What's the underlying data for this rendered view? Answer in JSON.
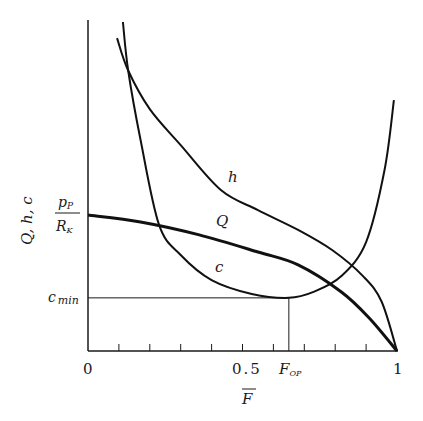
{
  "chart_data": {
    "type": "line",
    "title": "",
    "xlabel": "F̄",
    "ylabel": "Q, h, c",
    "xlim": [
      0,
      1
    ],
    "ylim": [
      0,
      1
    ],
    "grid": false,
    "legend": "inline curve labels",
    "x_tick_labels": [
      "0",
      "0.5",
      "1"
    ],
    "x_minor_ticks": [
      0.1,
      0.2,
      0.3,
      0.4,
      0.5,
      0.6,
      0.7,
      0.8,
      0.9
    ],
    "annotations": {
      "y_marker_pp_rk": {
        "label_num": "p_P",
        "label_den": "R_K",
        "y": 0.412
      },
      "y_marker_cmin": {
        "label": "c",
        "label_sub": "min",
        "y": 0.161
      },
      "x_marker_fop": {
        "label": "F",
        "label_sub": "OP",
        "x": 0.65
      }
    },
    "series": [
      {
        "name": "Q",
        "x": [
          0,
          0.17,
          0.36,
          0.55,
          0.68,
          0.82,
          0.91,
          1.0
        ],
        "y": [
          0.412,
          0.391,
          0.352,
          0.3,
          0.261,
          0.179,
          0.1,
          0.0
        ]
      },
      {
        "name": "h",
        "x": [
          0.094,
          0.13,
          0.2,
          0.3,
          0.43,
          0.55,
          0.68,
          0.79,
          0.89,
          0.95,
          1.0
        ],
        "y": [
          0.948,
          0.85,
          0.733,
          0.624,
          0.488,
          0.427,
          0.367,
          0.306,
          0.227,
          0.15,
          0.0
        ]
      },
      {
        "name": "c",
        "x": [
          0.113,
          0.13,
          0.17,
          0.23,
          0.3,
          0.4,
          0.53,
          0.65,
          0.73,
          0.82,
          0.9,
          0.96,
          0.99
        ],
        "y": [
          0.997,
          0.85,
          0.64,
          0.382,
          0.291,
          0.215,
          0.173,
          0.161,
          0.179,
          0.227,
          0.33,
          0.55,
          0.76
        ]
      }
    ]
  },
  "labels": {
    "y_axis": "Q,  h,  c",
    "x_axis": "F",
    "x0": "0",
    "x05": "0.5",
    "x1": "1",
    "fop_main": "F",
    "fop_sub": "OP",
    "pp_num": "p",
    "pp_num_sub": "P",
    "pp_den": "R",
    "pp_den_sub": "K",
    "cmin_main": "c",
    "cmin_sub": "min",
    "curve_h": "h",
    "curve_Q": "Q",
    "curve_c": "c"
  }
}
